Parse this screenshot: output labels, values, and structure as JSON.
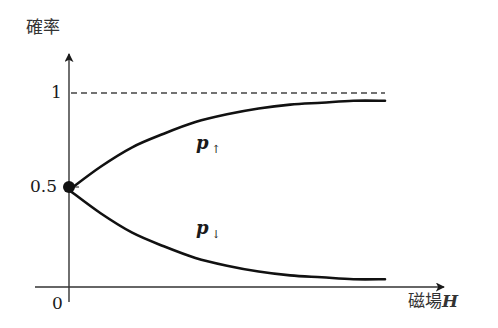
{
  "chart_data": {
    "type": "line",
    "title": "",
    "xlabel": "磁場H",
    "ylabel": "確率",
    "x_label_text": "磁場",
    "x_label_var": "H",
    "ytick_labels": [
      "1",
      "0.5"
    ],
    "origin_label": "0",
    "reference_line": {
      "y": 1,
      "style": "dashed"
    },
    "start_point": {
      "x": 0,
      "y": 0.5,
      "marker": "filled-circle"
    },
    "series": [
      {
        "name": "p↑",
        "label_main": "p",
        "label_sub": "↑",
        "description": "increases from 0.5 at H=0 and saturates toward 1",
        "x": [
          0,
          0.1,
          0.2,
          0.3,
          0.4,
          0.5,
          0.6,
          0.7,
          0.8,
          0.9,
          1.0
        ],
        "values": [
          0.5,
          0.62,
          0.72,
          0.79,
          0.85,
          0.89,
          0.92,
          0.94,
          0.95,
          0.96,
          0.96
        ]
      },
      {
        "name": "p↓",
        "label_main": "p",
        "label_sub": "↓",
        "description": "decreases from 0.5 at H=0 and saturates toward 0",
        "x": [
          0,
          0.1,
          0.2,
          0.3,
          0.4,
          0.5,
          0.6,
          0.7,
          0.8,
          0.9,
          1.0
        ],
        "values": [
          0.5,
          0.38,
          0.28,
          0.21,
          0.15,
          0.11,
          0.08,
          0.06,
          0.05,
          0.04,
          0.04
        ]
      }
    ],
    "xlim": [
      0,
      1.15
    ],
    "ylim": [
      0,
      1.2
    ],
    "grid": false,
    "legend": "inline labels"
  }
}
